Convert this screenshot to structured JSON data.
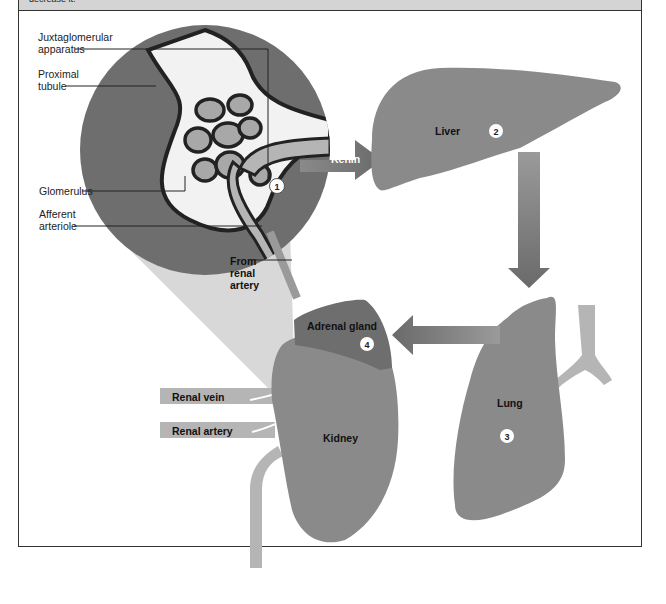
{
  "header": {
    "text": "decrease it."
  },
  "colors": {
    "organ": "#8a8a8a",
    "dark_organ": "#6e6e6e",
    "light_vessel": "#b5b5b5",
    "cone": "#d8d8d8",
    "frame": "#333333",
    "header_band": "#d4d4d4"
  },
  "inset": {
    "labels": {
      "juxtaglomerular": "Juxtaglomerular\napparatus",
      "juxtaglomerular_line1": "Juxtaglomerular",
      "juxtaglomerular_line2": "apparatus",
      "proximal_line1": "Proximal",
      "proximal_line2": "tubule",
      "glomerulus": "Glomerulus",
      "afferent_line1": "Afferent",
      "afferent_line2": "arteriole",
      "from_line1": "From",
      "from_line2": "renal",
      "from_line3": "artery"
    },
    "step_marker": "1"
  },
  "arrows": {
    "renin": "Renin"
  },
  "organs": {
    "liver": {
      "label": "Liver",
      "step": "2"
    },
    "lung": {
      "label": "Lung",
      "step": "3"
    },
    "adrenal": {
      "label": "Adrenal gland",
      "step": "4"
    },
    "kidney": {
      "label": "Kidney"
    },
    "renal_vein": {
      "label": "Renal vein"
    },
    "renal_artery": {
      "label": "Renal artery"
    }
  }
}
